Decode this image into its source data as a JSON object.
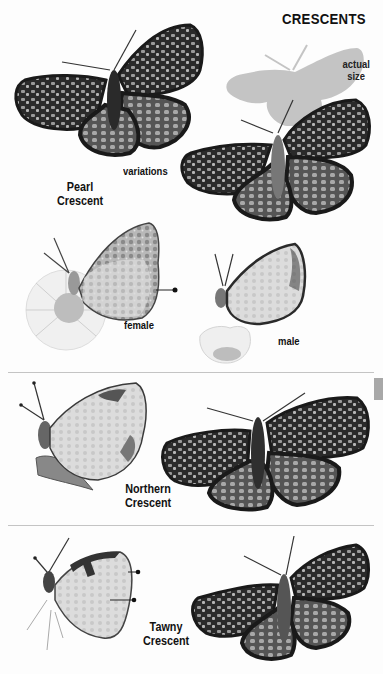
{
  "page": {
    "title": "CRESCENTS",
    "actual_size_label": "actual size",
    "actual_size_line1": "actual",
    "actual_size_line2": "size",
    "colors": {
      "ink": "#111111",
      "silhouette": "#c4c4c4",
      "divider": "#c4c4c4",
      "thumb_tab": "#a8a8a8",
      "wing_dark": "#1e1e1e",
      "wing_mid": "#6e6e6e",
      "wing_light": "#cfcfcf"
    }
  },
  "sections": [
    {
      "species": "Pearl Crescent",
      "species_line1": "Pearl",
      "species_line2": "Crescent",
      "labels": {
        "variations": "variations",
        "female": "female",
        "male": "male"
      },
      "illustrations": [
        {
          "view": "upperside",
          "note": "variation 1"
        },
        {
          "view": "upperside",
          "note": "variation 2"
        },
        {
          "view": "underside",
          "sex": "female",
          "perched_on": "daisy"
        },
        {
          "view": "underside",
          "sex": "male",
          "perched_on": "daisy"
        }
      ]
    },
    {
      "species": "Northern Crescent",
      "species_line1": "Northern",
      "species_line2": "Crescent",
      "illustrations": [
        {
          "view": "underside"
        },
        {
          "view": "upperside"
        }
      ]
    },
    {
      "species": "Tawny Crescent",
      "species_line1": "Tawny",
      "species_line2": "Crescent",
      "illustrations": [
        {
          "view": "underside"
        },
        {
          "view": "upperside"
        }
      ]
    }
  ]
}
